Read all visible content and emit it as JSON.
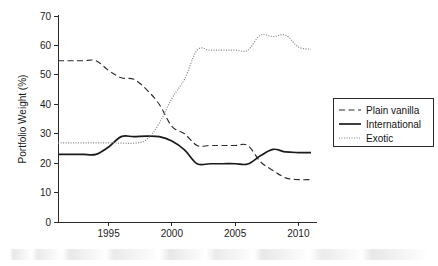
{
  "chart_data": {
    "type": "line",
    "title": "",
    "xlabel": "",
    "ylabel": "Portfolio Weight (%)",
    "xlim": [
      1991,
      2011
    ],
    "ylim": [
      0,
      70
    ],
    "yticks": [
      0,
      10,
      20,
      30,
      40,
      50,
      60,
      70
    ],
    "xticks": [
      1995,
      2000,
      2005,
      2010
    ],
    "xtick_labels": [
      "1995",
      "2000",
      "2005",
      "2010"
    ],
    "ytick_labels": [
      "0",
      "10",
      "20",
      "30",
      "40",
      "50",
      "60",
      "70"
    ],
    "grid": false,
    "legend_position": "right",
    "x": [
      1991,
      1992,
      1993,
      1994,
      1995,
      1996,
      1997,
      1998,
      1999,
      2000,
      2001,
      2002,
      2003,
      2004,
      2005,
      2006,
      2007,
      2008,
      2009,
      2010,
      2011
    ],
    "series": [
      {
        "name": "Plain vanilla",
        "style": "dashed",
        "color": "#2b2b2b",
        "values": [
          54.8,
          54.8,
          54.8,
          54.8,
          51.5,
          49.0,
          48.5,
          45.0,
          40.0,
          32.5,
          30.0,
          26.0,
          26.0,
          26.0,
          26.0,
          26.0,
          20.5,
          17.5,
          15.0,
          14.4,
          14.4
        ]
      },
      {
        "name": "International",
        "style": "solid",
        "color": "#1a1a1a",
        "values": [
          23.0,
          23.0,
          23.0,
          23.0,
          25.5,
          29.0,
          29.0,
          29.2,
          29.0,
          27.5,
          24.5,
          19.8,
          19.8,
          19.8,
          19.8,
          19.7,
          22.5,
          24.7,
          23.8,
          23.6,
          23.6
        ]
      },
      {
        "name": "Exotic",
        "style": "dotted",
        "color": "#8a8a8a",
        "values": [
          26.9,
          26.9,
          26.9,
          26.9,
          26.9,
          26.8,
          26.8,
          28.0,
          33.5,
          42.0,
          48.5,
          58.4,
          58.4,
          58.4,
          58.4,
          58.4,
          63.5,
          63.0,
          63.5,
          59.5,
          58.7
        ]
      }
    ]
  },
  "legend": {
    "items": [
      {
        "label": "Plain vanilla",
        "style": "dashed"
      },
      {
        "label": "International",
        "style": "solid"
      },
      {
        "label": "Exotic",
        "style": "dotted"
      }
    ]
  }
}
